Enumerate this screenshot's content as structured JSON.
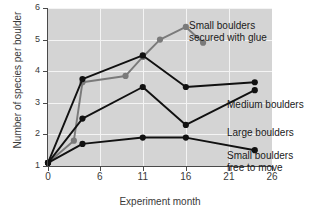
{
  "chart_data": {
    "type": "line",
    "title": "",
    "xlabel": "Experiment month",
    "ylabel": "Number of species per boulder",
    "xlim": [
      0,
      26
    ],
    "ylim": [
      1,
      6
    ],
    "xticks": [
      0,
      6,
      11,
      16,
      21,
      26
    ],
    "yticks": [
      1,
      2,
      3,
      4,
      5,
      6
    ],
    "xtick_labels": [
      "0",
      "6",
      "11",
      "16",
      "21",
      "26"
    ],
    "ytick_labels": [
      "1",
      "2",
      "3",
      "4",
      "5",
      "6"
    ],
    "grid": true,
    "legend_position": "inline-annotations",
    "plot_background": "#d4d4d4",
    "series": [
      {
        "name": "Small boulders secured with glue",
        "color": "#7a7a7a",
        "label_text": "Small boulders\nsecured with glue",
        "x": [
          0,
          3,
          4,
          9,
          11,
          13,
          16,
          18
        ],
        "y": [
          1.1,
          1.8,
          3.65,
          3.85,
          4.45,
          5.0,
          5.4,
          4.9
        ]
      },
      {
        "name": "Medium boulders",
        "color": "#111111",
        "label_text": "Medium boulders",
        "x": [
          0,
          4,
          11,
          16,
          24
        ],
        "y": [
          1.1,
          3.75,
          4.5,
          3.5,
          3.65
        ]
      },
      {
        "name": "Large boulders",
        "color": "#111111",
        "label_text": "Large boulders",
        "x": [
          0,
          4,
          11,
          16,
          24
        ],
        "y": [
          1.1,
          2.5,
          3.5,
          2.3,
          3.4
        ]
      },
      {
        "name": "Small boulders free to move",
        "color": "#111111",
        "label_text": "Small boulders\nfree to move",
        "x": [
          0,
          4,
          11,
          16,
          24
        ],
        "y": [
          1.1,
          1.7,
          1.9,
          1.9,
          1.5
        ]
      }
    ],
    "annotations": [
      {
        "text": "Small boulders\nsecured with glue",
        "series": "Small boulders secured with glue"
      },
      {
        "text": "Medium boulders",
        "series": "Medium boulders"
      },
      {
        "text": "Large boulders",
        "series": "Large boulders"
      },
      {
        "text": "Small boulders\nfree to move",
        "series": "Small boulders free to move"
      }
    ]
  }
}
